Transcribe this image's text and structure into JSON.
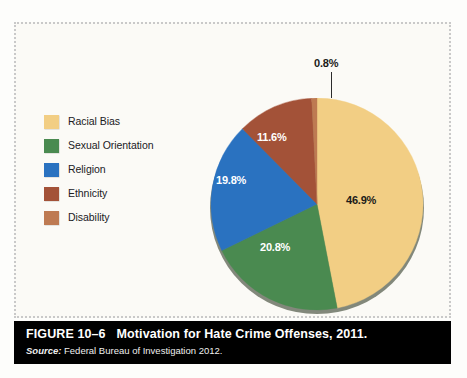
{
  "figure": {
    "caption_number": "FIGURE 10–6",
    "caption_title": "Motivation for Hate Crime Offenses, 2011.",
    "source_word": "Source:",
    "source_text": "Federal Bureau of Investigation 2012."
  },
  "legend": {
    "items": [
      {
        "label": "Racial Bias",
        "color": "#F2CE84"
      },
      {
        "label": "Sexual Orientation",
        "color": "#4A8A50"
      },
      {
        "label": "Religion",
        "color": "#2A72C0"
      },
      {
        "label": "Ethnicity",
        "color": "#A35238"
      },
      {
        "label": "Disability",
        "color": "#BE7A52"
      }
    ]
  },
  "labels": {
    "racial_bias": "46.9%",
    "sexual_orientation": "20.8%",
    "religion": "19.8%",
    "ethnicity": "11.6%",
    "disability": "0.8%"
  },
  "chart_data": {
    "type": "pie",
    "title": "Motivation for Hate Crime Offenses, 2011.",
    "source": "Federal Bureau of Investigation 2012.",
    "unit": "percent",
    "start_angle_deg": 0,
    "direction": "clockwise",
    "legend_position": "left",
    "categories": [
      "Racial Bias",
      "Sexual Orientation",
      "Religion",
      "Ethnicity",
      "Disability"
    ],
    "values": [
      46.9,
      20.8,
      19.8,
      11.6,
      0.8
    ],
    "colors": [
      "#F2CE84",
      "#4A8A50",
      "#2A72C0",
      "#A35238",
      "#BE7A52"
    ],
    "data_labels": [
      "46.9%",
      "20.8%",
      "19.8%",
      "11.6%",
      "0.8%"
    ],
    "total": 99.9
  }
}
